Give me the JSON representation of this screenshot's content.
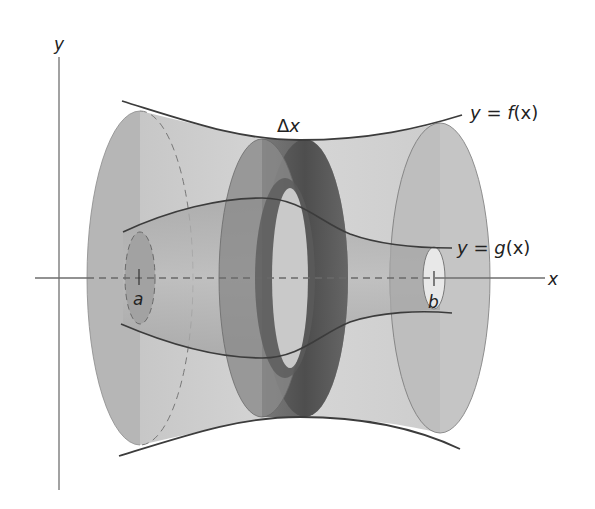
{
  "figure": {
    "type": "solid of revolution (washer method)",
    "axes": {
      "x_label": "x",
      "y_label": "y"
    },
    "labels": {
      "outer_curve": "y = f(x)",
      "outer_curve_parts": {
        "lhs": "y",
        "eq": " = ",
        "fn": "f",
        "arg": "(x)"
      },
      "inner_curve": "y = g(x)",
      "inner_curve_parts": {
        "lhs": "y",
        "eq": " = ",
        "fn": "g",
        "arg": "(x)"
      },
      "slice_width": "Δx",
      "slice_width_parts": {
        "delta": "Δ",
        "var": "x"
      },
      "left_bound": "a",
      "right_bound": "b"
    },
    "colors": {
      "background": "#ffffff",
      "outer_solid_fill": "#b4b4b4",
      "inner_solid_fill": "#9a9a9a",
      "washer_front": "#7c7c7c",
      "washer_band": "#4e4e4e",
      "curve_stroke": "#3c3c3c",
      "axis_stroke": "#6e6e6e"
    }
  }
}
